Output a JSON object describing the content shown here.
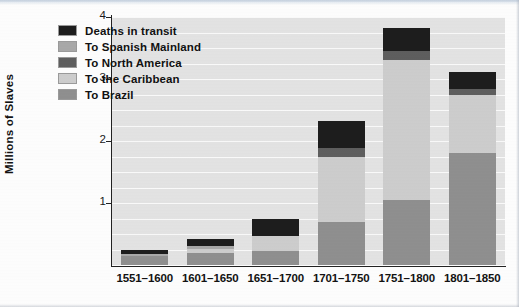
{
  "chart_data": {
    "type": "bar",
    "stacked": true,
    "title": "",
    "subtitle": "",
    "xlabel": "",
    "ylabel": "Millions of Slaves",
    "ylim": [
      0,
      4
    ],
    "yticks": [
      "1",
      "2",
      "3",
      "4"
    ],
    "ytick_values": [
      1,
      2,
      3,
      4
    ],
    "gridlines": true,
    "gridline_interval": 0.25,
    "legend_position": "top-left inside plot",
    "categories": [
      "1551–1600",
      "1601–1650",
      "1651–1700",
      "1701–1750",
      "1751–1800",
      "1801–1850"
    ],
    "series": [
      {
        "name": "To Brazil",
        "color": "#8f8f8f",
        "values": [
          0.15,
          0.2,
          0.22,
          0.7,
          1.05,
          1.8
        ]
      },
      {
        "name": "To the Caribbean",
        "color": "#cdcdcd",
        "values": [
          0.0,
          0.06,
          0.25,
          1.05,
          2.25,
          0.95
        ]
      },
      {
        "name": "To North America",
        "color": "#5e5e5e",
        "values": [
          0.0,
          0.0,
          0.0,
          0.14,
          0.16,
          0.09
        ]
      },
      {
        "name": "To Spanish Mainland",
        "color": "#a8a8a8",
        "values": [
          0.03,
          0.04,
          0.0,
          0.0,
          0.0,
          0.0
        ]
      },
      {
        "name": "Deaths in transit",
        "color": "#1d1d1d",
        "values": [
          0.07,
          0.12,
          0.28,
          0.43,
          0.36,
          0.28
        ]
      }
    ],
    "totals": [
      0.25,
      0.42,
      0.75,
      2.32,
      3.82,
      3.12
    ]
  },
  "legend": {
    "items": [
      {
        "label": "Deaths in transit",
        "color": "#1d1d1d"
      },
      {
        "label": "To Spanish Mainland",
        "color": "#a8a8a8"
      },
      {
        "label": "To North America",
        "color": "#5e5e5e"
      },
      {
        "label": "To the Caribbean",
        "color": "#cdcdcd"
      },
      {
        "label": "To Brazil",
        "color": "#8f8f8f"
      }
    ]
  },
  "axes": {
    "y_title": "Millions of Slaves",
    "y_ticks": [
      "4",
      "3",
      "2",
      "1"
    ],
    "x_ticks": [
      "1551–1600",
      "1601–1650",
      "1651–1700",
      "1701–1750",
      "1751–1800",
      "1801–1850"
    ]
  },
  "colors": {
    "plot_background": "#e3e3e3",
    "gridline": "#fafafa",
    "axis": "#222222",
    "page_background": "#fdfdfd"
  }
}
